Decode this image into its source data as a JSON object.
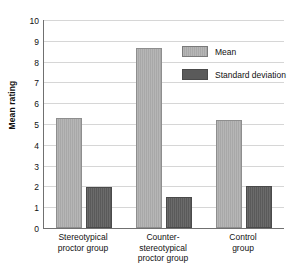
{
  "chart_data": {
    "type": "bar",
    "title": "",
    "xlabel": "",
    "ylabel": "Mean rating",
    "ylim": [
      0,
      10
    ],
    "ytick_step": 1,
    "yticks": [
      "10",
      "9",
      "8",
      "7",
      "6",
      "5",
      "4",
      "3",
      "2",
      "1",
      "0"
    ],
    "grid": true,
    "legend_position": "upper right",
    "categories": [
      "Stereotypical\nproctor group",
      "Counter-\nstereotypical\nproctor group",
      "Control\ngroup"
    ],
    "category_lines": [
      [
        "Stereotypical",
        "proctor group"
      ],
      [
        "Counter-",
        "stereotypical",
        "proctor group"
      ],
      [
        "Control",
        "group"
      ]
    ],
    "series": [
      {
        "name": "Mean",
        "color": "#a8a8a8",
        "values": [
          5.3,
          8.67,
          5.2
        ]
      },
      {
        "name": "Standard deviation",
        "color": "#5a5a5a",
        "values": [
          1.95,
          1.5,
          2.0
        ]
      }
    ]
  },
  "axis": {
    "y_title": "Mean rating",
    "tick_0": "0",
    "tick_1": "1",
    "tick_2": "2",
    "tick_3": "3",
    "tick_4": "4",
    "tick_5": "5",
    "tick_6": "6",
    "tick_7": "7",
    "tick_8": "8",
    "tick_9": "9",
    "tick_10": "10"
  },
  "legend": {
    "items": [
      {
        "label": "Mean",
        "color": "#a8a8a8"
      },
      {
        "label": "Standard deviation",
        "color": "#5a5a5a"
      }
    ]
  },
  "categories": {
    "g1_line1": "Stereotypical",
    "g1_line2": "proctor group",
    "g2_line1": "Counter-",
    "g2_line2": "stereotypical",
    "g2_line3": "proctor group",
    "g3_line1": "Control",
    "g3_line2": "group"
  },
  "colors": {
    "mean": "#a8a8a8",
    "standard_deviation": "#5a5a5a",
    "grid": "#d6d6d6",
    "axis": "#707070",
    "background": "#ffffff"
  }
}
